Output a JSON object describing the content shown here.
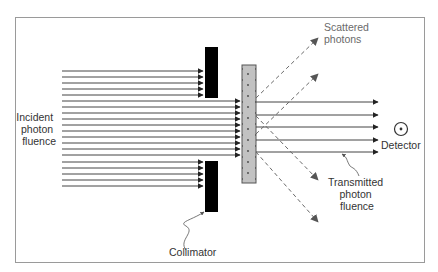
{
  "diagram": {
    "labels": {
      "incident": [
        "Incident",
        "photon",
        "fluence"
      ],
      "collimator": "Collimator",
      "scattered": [
        "Scattered",
        "photons"
      ],
      "detector": "Detector",
      "transmitted": [
        "Transmitted",
        "photon",
        "fluence"
      ]
    },
    "components": {
      "collimator_upper": {
        "x": 205,
        "y": 47,
        "w": 13,
        "h": 51,
        "color": "#000000"
      },
      "collimator_lower": {
        "x": 205,
        "y": 161,
        "w": 13,
        "h": 51,
        "color": "#000000"
      },
      "attenuator": {
        "x": 242,
        "y": 65,
        "w": 14,
        "h": 118,
        "color": "#bdbdbd"
      },
      "detector": {
        "cx": 401,
        "cy": 129,
        "r": 6
      }
    },
    "colors": {
      "frame": "#9a9a9a",
      "beam": "#333333",
      "scatter": "#6a6a6a",
      "text": "#333333"
    },
    "counts": {
      "incident_rays_blocked_upper": 5,
      "incident_rays_passing": 10,
      "incident_rays_blocked_lower": 5,
      "transmitted_rays": 5,
      "scattered_rays": 4
    }
  }
}
